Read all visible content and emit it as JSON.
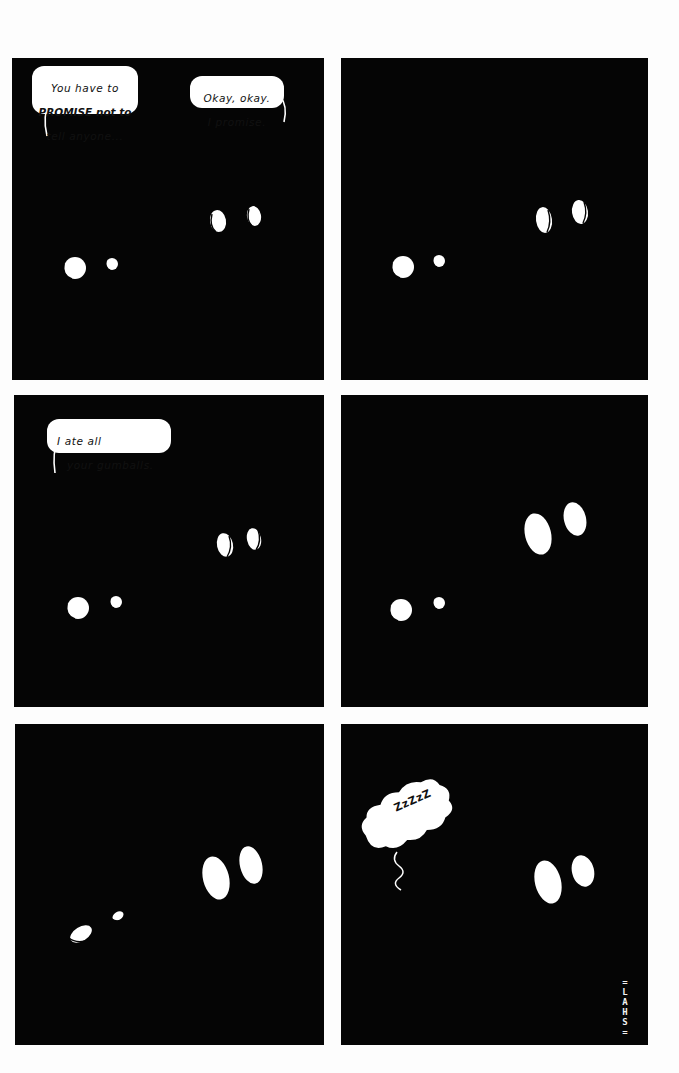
{
  "comic": {
    "panel_count": 6,
    "colors": {
      "page_background": "#fdfdfd",
      "panel_background": "#050505",
      "eyes": "#ffffff",
      "bubble": "#ffffff",
      "bubble_text": "#111111"
    },
    "panels": [
      {
        "id": 1,
        "bubbles": [
          {
            "speaker": "left",
            "lines": [
              "You have to",
              "PROMISE not to",
              "tell anyone..."
            ],
            "emphasis": "PROMISE"
          },
          {
            "speaker": "right",
            "lines": [
              "Okay, okay.",
              "I promise."
            ]
          }
        ],
        "eyes": "both characters looking at each other"
      },
      {
        "id": 2,
        "bubbles": [],
        "eyes": "silent pause"
      },
      {
        "id": 3,
        "bubbles": [
          {
            "speaker": "left",
            "lines": [
              "I ate all",
              "your gumballs."
            ]
          }
        ],
        "eyes": "both characters looking at each other"
      },
      {
        "id": 4,
        "bubbles": [],
        "eyes": "right character's eyes widen"
      },
      {
        "id": 5,
        "bubbles": [],
        "eyes": "left character's eyes close, right character stares"
      },
      {
        "id": 6,
        "bubbles": [],
        "thought": {
          "text": "ZzZzZ"
        },
        "eyes": "left character asleep and gone, right character staring",
        "signature": [
          "=",
          "L",
          "A",
          "H",
          "S",
          "="
        ]
      }
    ]
  }
}
